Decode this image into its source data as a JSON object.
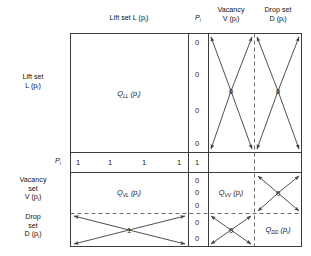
{
  "diagram": {
    "type": "block-matrix-partition",
    "column_headers": [
      {
        "id": "lift",
        "line1": "Lift set",
        "inline": "Lift set L (p",
        "sub": "i",
        "tail": ")"
      },
      {
        "id": "pi",
        "line1": "P",
        "sub": "i"
      },
      {
        "id": "vacancy",
        "line1": "Vacancy",
        "line2": "V (p",
        "sub": "i",
        "tail": ")"
      },
      {
        "id": "drop",
        "line1": "Drop set",
        "line2": "D (p",
        "sub": "i",
        "tail": ")"
      }
    ],
    "row_headers": [
      {
        "id": "lift",
        "line1": "Lift set",
        "line2": "L (p",
        "sub": "i",
        "tail": ")"
      },
      {
        "id": "pi",
        "line1": "P",
        "sub": "i"
      },
      {
        "id": "vacancy",
        "line1": "Vacancy",
        "line2": "set",
        "line3": "V (p",
        "sub": "i",
        "tail": ")"
      },
      {
        "id": "drop",
        "line1": "Drop",
        "line2": "set",
        "line3": "D (p",
        "sub": "i",
        "tail": ")"
      }
    ],
    "header_text": {
      "lift_set_top": "Lift set L (p",
      "pi_top": "P",
      "vacancy_top_1": "Vacancy",
      "vacancy_top_2": "V (p",
      "drop_top_1": "Drop set",
      "drop_top_2": "D (p",
      "paren": ")",
      "sub_i": "i"
    },
    "side_text": {
      "lift_set_1": "Lift set",
      "lift_set_2": "L (p",
      "pi": "P",
      "vacancy_1": "Vacancy",
      "vacancy_2": "set",
      "vacancy_3": "V (p",
      "drop_1": "Drop",
      "drop_2": "set",
      "drop_3": "D (p"
    },
    "blocks": [
      {
        "name": "Q_LL",
        "base": "Q",
        "sub": "LL",
        "arg": " (p",
        "argsub": "i",
        "tail": ")",
        "row": "lift",
        "col": "lift"
      },
      {
        "name": "Q_VL",
        "base": "Q",
        "sub": "VL",
        "arg": " (p",
        "argsub": "i",
        "tail": ")",
        "row": "vacancy",
        "col": "lift"
      },
      {
        "name": "Q_VV",
        "base": "Q",
        "sub": "VV",
        "arg": " (p",
        "argsub": "i",
        "tail": ")",
        "row": "vacancy",
        "col": "vacancy"
      },
      {
        "name": "Q_DD",
        "base": "Q",
        "sub": "DD",
        "arg": " (p",
        "argsub": "i",
        "tail": ")",
        "row": "drop",
        "col": "drop"
      }
    ],
    "pi_row_entries": [
      "1",
      "1",
      "1",
      "1"
    ],
    "pi_row_pi_cell": "1",
    "pi_column_entries": {
      "lift": [
        "0",
        "0",
        "0",
        "0"
      ],
      "pi": "1",
      "vacancy": [
        "0",
        "0",
        "0"
      ],
      "drop": [
        "0",
        "0"
      ]
    },
    "cross_values": {
      "lift_vacancy": "0",
      "lift_drop": "0",
      "vacancy_drop": "0",
      "drop_lift": "1",
      "drop_vacancy": "0"
    },
    "colors": {
      "line": "#3c3c3c",
      "text": "#141414",
      "dashed": "#6e6e6e",
      "background": "#ffffff"
    }
  }
}
